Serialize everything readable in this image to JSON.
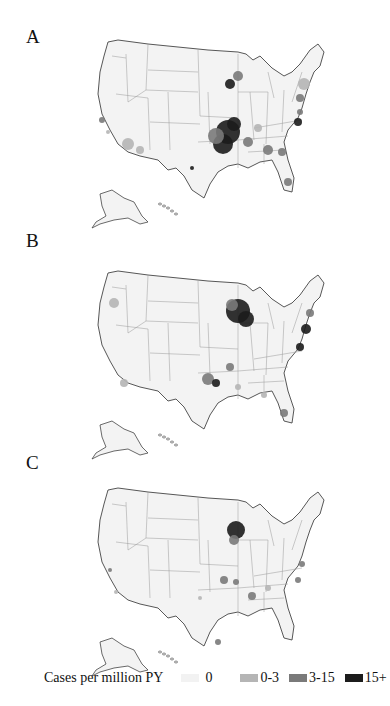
{
  "figure": {
    "panels": [
      {
        "label": "A",
        "hotspots": [
          "Missouri/Arkansas/Oklahoma (Ozarks)",
          "Minnesota",
          "Mid-Atlantic",
          "Southeast"
        ]
      },
      {
        "label": "B",
        "hotspots": [
          "Minnesota/Wisconsin",
          "Northeast coast",
          "Oklahoma"
        ]
      },
      {
        "label": "C",
        "hotspots": [
          "Wisconsin",
          "Missouri/Tennessee scattered"
        ]
      }
    ],
    "legend": {
      "title": "Cases per million PY",
      "items": [
        {
          "label": "0",
          "color": "#f2f2f2"
        },
        {
          "label": "0-3",
          "color": "#b5b5b5"
        },
        {
          "label": "3-15",
          "color": "#7a7a7a"
        },
        {
          "label": "15+",
          "color": "#1c1c1c"
        }
      ]
    },
    "colors": {
      "state_fill": "#f3f3f3",
      "border": "#555555",
      "state_line": "#aaaaaa"
    }
  }
}
